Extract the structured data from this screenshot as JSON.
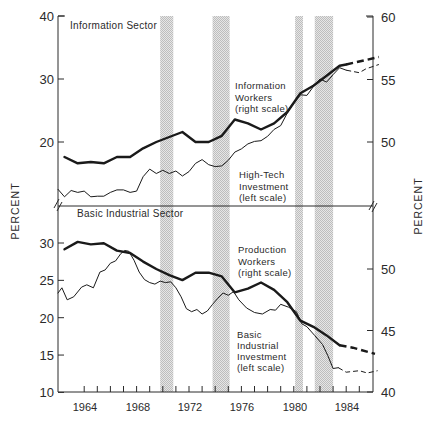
{
  "chart_data": [
    {
      "type": "line",
      "panel": "top",
      "title": "Information Sector",
      "xlabel": "",
      "ylabel_left": "PERCENT",
      "ylabel_right": "PERCENT",
      "ylim_left": [
        12,
        40
      ],
      "ylim_right": [
        45.7,
        60
      ],
      "yticks_left": [
        20,
        30,
        40
      ],
      "yticks_right": [
        50,
        55,
        60
      ],
      "xlim": [
        1962,
        1986.5
      ],
      "grid": false,
      "recession_bands": [
        [
          1969.8,
          1970.8
        ],
        [
          1973.8,
          1975.1
        ],
        [
          1980.1,
          1980.7
        ],
        [
          1981.6,
          1983.0
        ]
      ],
      "series": [
        {
          "name": "Information Workers",
          "annotation": [
            "Information",
            "Workers",
            "(right scale)"
          ],
          "axis": "right",
          "style": "thick",
          "x": [
            1962.5,
            1963.5,
            1964.5,
            1965.5,
            1966.5,
            1967.5,
            1968.5,
            1969.5,
            1970.5,
            1971.5,
            1972.5,
            1973.5,
            1974.5,
            1975.5,
            1976.5,
            1977.5,
            1978.5,
            1979.5,
            1980.5,
            1981.5,
            1982.5,
            1983.5,
            1984
          ],
          "y": [
            48.8,
            48.3,
            48.4,
            48.3,
            48.8,
            48.8,
            49.5,
            50.0,
            50.4,
            50.8,
            50.0,
            50.0,
            50.5,
            51.8,
            51.5,
            51.0,
            51.5,
            52.4,
            53.9,
            54.5,
            55.3,
            56.1,
            56.2
          ],
          "projection_x": [
            1984,
            1986.5
          ],
          "projection_y": [
            56.2,
            56.8
          ]
        },
        {
          "name": "High-Tech Investment",
          "annotation": [
            "High-Tech",
            "Investment",
            "(left scale)"
          ],
          "axis": "left",
          "style": "thin",
          "x": [
            1962,
            1962.5,
            1963,
            1963.5,
            1964,
            1964.5,
            1965,
            1965.5,
            1966,
            1966.5,
            1967,
            1967.5,
            1968,
            1968.5,
            1969,
            1969.5,
            1970,
            1970.5,
            1971,
            1971.5,
            1972,
            1972.5,
            1973,
            1973.5,
            1974,
            1974.5,
            1975,
            1975.5,
            1976,
            1976.5,
            1977,
            1977.5,
            1978,
            1978.5,
            1979,
            1979.5,
            1980,
            1980.5,
            1981,
            1981.5,
            1982,
            1982.5,
            1983,
            1983.5,
            1984
          ],
          "y": [
            12.5,
            11.3,
            12.3,
            12.0,
            12.2,
            11.3,
            11.4,
            11.4,
            12.0,
            12.4,
            12.4,
            12.0,
            12.2,
            14.5,
            15.7,
            15.0,
            15.5,
            15.0,
            15.4,
            14.6,
            15.3,
            16.6,
            17.2,
            16.4,
            16.1,
            16.2,
            17.1,
            18.4,
            18.9,
            19.7,
            20.1,
            20.2,
            20.9,
            22.0,
            22.6,
            24.6,
            26.2,
            27.5,
            27.4,
            28.8,
            30.0,
            29.5,
            30.7,
            31.8,
            31.4
          ],
          "projection_x": [
            1984,
            1985,
            1985.5,
            1986.5
          ],
          "projection_y": [
            31.4,
            31.0,
            31.6,
            32.3
          ]
        }
      ]
    },
    {
      "type": "line",
      "panel": "bottom",
      "title": "Basic Industrial Sector",
      "xlabel": "",
      "ylabel_left": "PERCENT",
      "ylabel_right": "PERCENT",
      "ylim_left": [
        10,
        32.5
      ],
      "ylim_right": [
        40,
        54
      ],
      "yticks_left": [
        10,
        15,
        20,
        25,
        30
      ],
      "yticks_right": [
        40,
        45,
        50
      ],
      "xticks": [
        1964,
        1968,
        1972,
        1976,
        1980,
        1984
      ],
      "xlim": [
        1962,
        1986.5
      ],
      "grid": false,
      "recession_bands": [
        [
          1969.8,
          1970.8
        ],
        [
          1973.8,
          1975.1
        ],
        [
          1980.1,
          1980.7
        ],
        [
          1981.6,
          1983.0
        ]
      ],
      "series": [
        {
          "name": "Production Workers",
          "annotation": [
            "Production",
            "Workers",
            "(right scale)"
          ],
          "axis": "right",
          "style": "thick",
          "x": [
            1962.5,
            1963.5,
            1964.5,
            1965.5,
            1966.5,
            1967.5,
            1968.5,
            1969.5,
            1970.5,
            1971.5,
            1972.5,
            1973.5,
            1974.5,
            1975.5,
            1976.5,
            1977.5,
            1978.5,
            1979.5,
            1980.5,
            1981.5,
            1982.5,
            1983.5
          ],
          "y": [
            51.6,
            52.2,
            52.0,
            52.1,
            51.5,
            51.3,
            50.6,
            50.0,
            49.5,
            49.1,
            49.7,
            49.7,
            49.4,
            48.1,
            48.4,
            48.9,
            48.3,
            47.3,
            45.8,
            45.3,
            44.6,
            43.8
          ],
          "projection_x": [
            1983.5,
            1984.5,
            1986.2
          ],
          "projection_y": [
            43.8,
            43.6,
            43.1
          ]
        },
        {
          "name": "Basic Industrial Investment",
          "annotation": [
            "Basic",
            "Industrial",
            "Investment",
            "(left scale)"
          ],
          "axis": "left",
          "style": "thin",
          "x": [
            1962,
            1962.3,
            1962.7,
            1963.2,
            1963.8,
            1964.2,
            1964.7,
            1965.2,
            1965.6,
            1966.0,
            1966.4,
            1966.8,
            1967.1,
            1967.4,
            1967.8,
            1968.2,
            1968.6,
            1969.0,
            1969.4,
            1969.8,
            1970.2,
            1970.6,
            1971.0,
            1971.4,
            1971.8,
            1972.2,
            1972.6,
            1973.0,
            1973.4,
            1973.8,
            1974.2,
            1974.6,
            1975.0,
            1975.4,
            1975.8,
            1976.4,
            1977.0,
            1977.6,
            1978.2,
            1978.6,
            1979.0,
            1979.6,
            1980.2,
            1980.6,
            1981.0,
            1981.6,
            1982.2,
            1982.6,
            1983.0,
            1983.4
          ],
          "y": [
            23.3,
            24.0,
            22.4,
            22.8,
            24.1,
            24.4,
            24.0,
            26.1,
            26.4,
            27.3,
            27.6,
            28.6,
            29.0,
            28.9,
            27.7,
            26.1,
            25.1,
            24.7,
            24.5,
            24.9,
            24.7,
            24.8,
            24.0,
            22.8,
            21.2,
            20.8,
            21.1,
            20.5,
            20.9,
            21.8,
            22.6,
            23.3,
            23.0,
            23.5,
            22.4,
            21.3,
            20.7,
            20.5,
            21.1,
            21.0,
            21.8,
            21.4,
            20.8,
            19.2,
            18.8,
            17.6,
            16.4,
            14.9,
            13.2,
            13.3
          ],
          "projection_x": [
            1983.4,
            1984,
            1985,
            1985.6,
            1986.4
          ],
          "projection_y": [
            13.3,
            12.7,
            12.9,
            12.6,
            12.9
          ]
        }
      ]
    }
  ],
  "labels": {
    "top_panel_title": "Information Sector",
    "bottom_panel_title": "Basic Industrial Sector",
    "ylabel_left": "PERCENT",
    "ylabel_right": "PERCENT",
    "top_left_ticks": [
      "40",
      "30",
      "20"
    ],
    "top_right_ticks": [
      "60",
      "55",
      "50"
    ],
    "bottom_left_ticks": [
      "30",
      "25",
      "20",
      "15",
      "10"
    ],
    "bottom_right_ticks": [
      "50",
      "45",
      "40"
    ],
    "year_ticks": [
      "1964",
      "1968",
      "1972",
      "1976",
      "1980",
      "1984"
    ],
    "info_workers": [
      "Information",
      "Workers",
      "(right scale)"
    ],
    "hightech": [
      "High-Tech",
      "Investment",
      "(left scale)"
    ],
    "production_workers": [
      "Production",
      "Workers",
      "(right scale)"
    ],
    "basic_investment": [
      "Basic",
      "Industrial",
      "Investment",
      "(left scale)"
    ]
  },
  "colors": {
    "line": "#1a1a1a",
    "band": "#cfcfcf",
    "text": "#2a2a2a"
  }
}
